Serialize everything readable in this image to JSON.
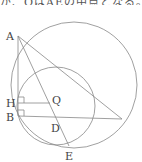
{
  "caption_fragment": "が、QはAEの中点となる。",
  "diagram": {
    "points": {
      "A": {
        "label": "A",
        "x": 18,
        "y": 36
      },
      "H": {
        "label": "H",
        "x": 18,
        "y": 103
      },
      "B": {
        "label": "B",
        "x": 18,
        "y": 116
      },
      "Q": {
        "label": "Q",
        "x": 55,
        "y": 101
      },
      "D": {
        "label": "D",
        "x": 55,
        "y": 117
      },
      "E": {
        "label": "E",
        "x": 69,
        "y": 146
      },
      "C": {
        "label": "",
        "x": 122,
        "y": 119
      }
    },
    "circles": [
      {
        "name": "large-circle",
        "cx": 74,
        "cy": 85,
        "r": 63
      },
      {
        "name": "small-circle",
        "cx": 56,
        "cy": 106,
        "r": 39
      }
    ],
    "colors": {
      "stroke": "#888888",
      "text": "#444444"
    }
  }
}
